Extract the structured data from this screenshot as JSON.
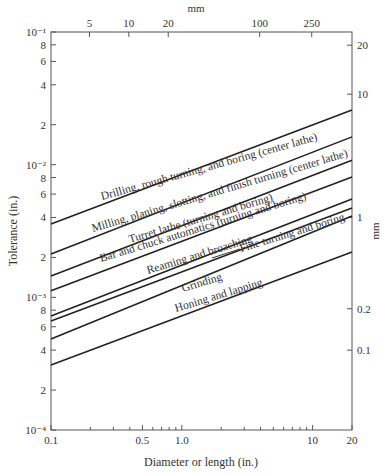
{
  "chart_data": {
    "type": "line",
    "title": "",
    "xlabel": "Diameter or length (in.)",
    "ylabel": "Tolerance (in.)",
    "x_scale": "log",
    "y_scale": "log",
    "xlim": [
      0.1,
      20
    ],
    "ylim": [
      0.0001,
      0.1
    ],
    "grid": false,
    "legend": "none (labels placed inline along lines)",
    "x_ticks_major": [
      {
        "value": 0.1,
        "label": "0.1"
      },
      {
        "value": 0.5,
        "label": "0.5"
      },
      {
        "value": 1.0,
        "label": "1.0"
      },
      {
        "value": 10,
        "label": "10"
      },
      {
        "value": 20,
        "label": "20"
      }
    ],
    "x_ticks_minor": [
      0.2,
      0.3,
      0.4,
      0.6,
      0.7,
      0.8,
      0.9,
      2,
      3,
      4,
      5,
      6,
      7,
      8,
      9
    ],
    "y_ticks": [
      {
        "value": 0.1,
        "label": "10⁻¹"
      },
      {
        "value": 0.08,
        "label": "8"
      },
      {
        "value": 0.06,
        "label": "6"
      },
      {
        "value": 0.04,
        "label": "4"
      },
      {
        "value": 0.02,
        "label": "2"
      },
      {
        "value": 0.01,
        "label": "10⁻²"
      },
      {
        "value": 0.008,
        "label": "8"
      },
      {
        "value": 0.006,
        "label": "6"
      },
      {
        "value": 0.004,
        "label": "4"
      },
      {
        "value": 0.002,
        "label": "2"
      },
      {
        "value": 0.001,
        "label": "10⁻³"
      },
      {
        "value": 0.0008,
        "label": "8"
      },
      {
        "value": 0.0006,
        "label": "6"
      },
      {
        "value": 0.0004,
        "label": "4"
      },
      {
        "value": 0.0002,
        "label": "2"
      },
      {
        "value": 0.0001,
        "label": "10⁻⁴"
      }
    ],
    "top_axis": {
      "label": "mm",
      "ticks": [
        {
          "value_in": 0.19685,
          "label": "5"
        },
        {
          "value_in": 0.3937,
          "label": "10"
        },
        {
          "value_in": 0.7874,
          "label": "20"
        },
        {
          "value_in": 3.937,
          "label": "100"
        },
        {
          "value_in": 9.8425,
          "label": "250"
        }
      ]
    },
    "right_axis": {
      "label": "mm",
      "ticks": [
        {
          "value_in": 0.0795,
          "label": "20"
        },
        {
          "value_in": 0.034,
          "label": "10"
        },
        {
          "value_in": 0.004,
          "label": "1"
        },
        {
          "value_in": 0.00082,
          "label": "0.2"
        },
        {
          "value_in": 0.0004,
          "label": "0.1"
        }
      ]
    },
    "x": [
      0.1,
      20
    ],
    "series": [
      {
        "name": "Drilling, rough turning, and boring (center lathe)",
        "values": [
          0.00357,
          0.0258
        ]
      },
      {
        "name": "Milling, planing, slotting, and finish turning (center lathe)",
        "values": [
          0.00212,
          0.0162
        ]
      },
      {
        "name": "Turret lathe (turning and boring)",
        "values": [
          0.00145,
          0.0108
        ]
      },
      {
        "name": "Bar and chuck automatics (turning and boring)",
        "values": [
          0.00112,
          0.00807
        ]
      },
      {
        "name": "Reaming and broaching",
        "values": [
          0.000723,
          0.00551
        ]
      },
      {
        "name": "Fine turning and boring",
        "values": [
          0.000664,
          0.00471
        ]
      },
      {
        "name": "Grinding",
        "values": [
          0.000486,
          0.0041
        ]
      },
      {
        "name": "Honing and lapping",
        "values": [
          0.000309,
          0.0022
        ]
      }
    ]
  },
  "labels": [
    {
      "text": "Drilling, rough turning, and boring (center lathe)",
      "x": 102,
      "y": 200,
      "angle": -15.5
    },
    {
      "text": "Milling, planing, slotting, and finish turning (center lathe)",
      "x": 93,
      "y": 232,
      "angle": -16.5
    },
    {
      "text": "Turret lathe (turning and boring)",
      "x": 130,
      "y": 243,
      "angle": -16.5
    },
    {
      "text": "Bar and chuck automatics (turning and boring)",
      "x": 101,
      "y": 262,
      "angle": -17
    },
    {
      "text": "Reaming and broaching",
      "x": 148,
      "y": 274,
      "angle": -17
    },
    {
      "text": "Fine turning and boring",
      "x": 241,
      "y": 252,
      "angle": -17
    },
    {
      "text": "Grinding",
      "x": 183,
      "y": 292,
      "angle": -17
    },
    {
      "text": "Honing and lapping",
      "x": 176,
      "y": 312,
      "angle": -17
    }
  ],
  "fine_turning_leader": {
    "x1": 212,
    "y1": 258,
    "x2": 240,
    "y2": 249
  }
}
